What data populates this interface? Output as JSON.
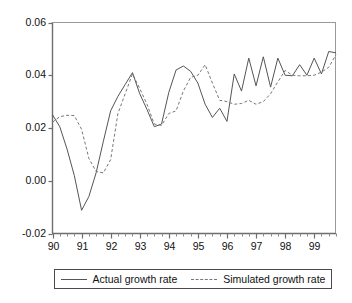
{
  "chart_data": {
    "type": "line",
    "title": "",
    "subtitle": "",
    "xlabel": "",
    "ylabel": "",
    "xlim": [
      1990.0,
      1999.75
    ],
    "ylim": [
      -0.02,
      0.06
    ],
    "grid": false,
    "legend_position": "bottom",
    "x_tick_labels": [
      "90",
      "91",
      "92",
      "93",
      "94",
      "95",
      "96",
      "97",
      "98",
      "99"
    ],
    "x_tick_values": [
      1990,
      1991,
      1992,
      1993,
      1994,
      1995,
      1996,
      1997,
      1998,
      1999
    ],
    "x_minor_ticks_per_major": 4,
    "y_tick_labels": [
      "0.06",
      "0.04",
      "0.02",
      "0.00",
      "-0.02"
    ],
    "y_tick_values": [
      0.06,
      0.04,
      0.02,
      0.0,
      -0.02
    ],
    "x": [
      1990.0,
      1990.25,
      1990.5,
      1990.75,
      1991.0,
      1991.25,
      1991.5,
      1991.75,
      1992.0,
      1992.25,
      1992.5,
      1992.75,
      1993.0,
      1993.25,
      1993.5,
      1993.75,
      1994.0,
      1994.25,
      1994.5,
      1994.75,
      1995.0,
      1995.25,
      1995.5,
      1995.75,
      1996.0,
      1996.25,
      1996.5,
      1996.75,
      1997.0,
      1997.25,
      1997.5,
      1997.75,
      1998.0,
      1998.25,
      1998.5,
      1998.75,
      1999.0,
      1999.25,
      1999.5,
      1999.75
    ],
    "series": [
      {
        "name": "Actual growth rate",
        "style": "solid",
        "color": "#555555",
        "values": [
          0.025,
          0.0205,
          0.012,
          0.002,
          -0.0112,
          -0.006,
          0.003,
          0.015,
          0.0265,
          0.032,
          0.0365,
          0.041,
          0.033,
          0.027,
          0.0205,
          0.0215,
          0.0335,
          0.042,
          0.0435,
          0.0415,
          0.037,
          0.029,
          0.024,
          0.0275,
          0.0225,
          0.0405,
          0.034,
          0.0465,
          0.036,
          0.047,
          0.0355,
          0.0465,
          0.04,
          0.0398,
          0.044,
          0.04,
          0.0465,
          0.0405,
          0.049,
          0.0485
        ]
      },
      {
        "name": "Simulated growth rate",
        "style": "dashed",
        "color": "#777777",
        "values": [
          0.0222,
          0.0243,
          0.0248,
          0.0247,
          0.0195,
          0.0085,
          0.0035,
          0.003,
          0.008,
          0.0255,
          0.033,
          0.0405,
          0.035,
          0.029,
          0.0215,
          0.021,
          0.0255,
          0.0265,
          0.034,
          0.0392,
          0.04,
          0.044,
          0.037,
          0.0305,
          0.03,
          0.029,
          0.0293,
          0.0305,
          0.029,
          0.03,
          0.033,
          0.0375,
          0.0418,
          0.04,
          0.0398,
          0.0398,
          0.04,
          0.0412,
          0.043,
          0.0478
        ]
      }
    ]
  },
  "legend": {
    "entries": [
      {
        "label": "Actual growth rate",
        "swatch": "solid-line-swatch"
      },
      {
        "label": "Simulated growth rate",
        "swatch": "dashed-line-swatch"
      }
    ]
  }
}
